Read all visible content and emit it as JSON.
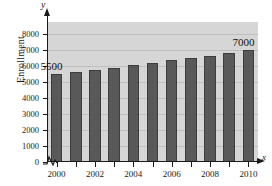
{
  "chart_data": {
    "type": "bar",
    "title": "",
    "xlabel": "x",
    "ylabel": "Enrollment",
    "categories": [
      2000,
      2001,
      2002,
      2003,
      2004,
      2005,
      2006,
      2007,
      2008,
      2009,
      2010
    ],
    "values": [
      5500,
      5600,
      5750,
      5900,
      6050,
      6200,
      6350,
      6500,
      6600,
      6800,
      7000
    ],
    "ylim": [
      0,
      8400
    ],
    "ytick_values": [
      0,
      1000,
      2000,
      3000,
      4000,
      5000,
      6000,
      7000,
      8000
    ],
    "ytick_labels": [
      "0",
      "1000",
      "2000",
      "3000",
      "4000",
      "5000",
      "6000",
      "7000",
      "8000"
    ],
    "xtick_values": [
      2000,
      2002,
      2004,
      2006,
      2008,
      2010
    ],
    "xtick_labels": [
      "2000",
      "2002",
      "2004",
      "2006",
      "2008",
      "2010"
    ],
    "grid": true,
    "legend": "none",
    "axis_break": true,
    "annotations": [
      {
        "text": "5500",
        "target_category": 2000
      },
      {
        "text": "7000",
        "target_category": 2010
      }
    ],
    "colors": {
      "bar_fill": "#595959",
      "bar_edge": "#3d3d3d",
      "plot_background": "#d6d6d6",
      "gridline": "#bfbfbf",
      "axis": "#1a1a1a",
      "text": "#1a1a1a"
    }
  },
  "axis_letters": {
    "y": "y",
    "x": "x"
  }
}
